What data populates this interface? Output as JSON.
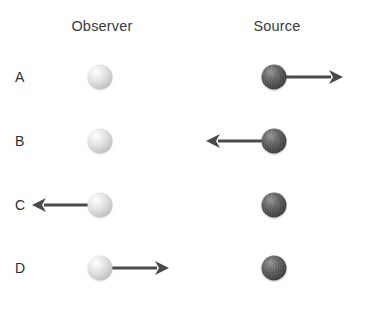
{
  "figure": {
    "background_color": "#ffffff",
    "width": 367,
    "height": 310
  },
  "columns": [
    {
      "key": "observer",
      "label": "Observer",
      "center_x": 102
    },
    {
      "key": "source",
      "label": "Source",
      "center_x": 277
    }
  ],
  "colors": {
    "light_sphere": "#dcdcdc",
    "dark_sphere": "#3f3f3f",
    "arrow": "#4a4a4a",
    "text": "#2e2e2e",
    "header_text": "#3a3a3a"
  },
  "rows": [
    {
      "label": "A",
      "center_y": 77,
      "observer": {
        "sphere": "light",
        "x": 100,
        "motion": "stationary",
        "arrow_label": ""
      },
      "source": {
        "sphere": "dark",
        "x": 274,
        "motion": "right",
        "arrow_label": "moving right"
      }
    },
    {
      "label": "B",
      "center_y": 141,
      "observer": {
        "sphere": "light",
        "x": 100,
        "motion": "stationary",
        "arrow_label": ""
      },
      "source": {
        "sphere": "dark",
        "x": 274,
        "motion": "left",
        "arrow_label": "moving left"
      }
    },
    {
      "label": "C",
      "center_y": 205,
      "observer": {
        "sphere": "light",
        "x": 100,
        "motion": "left",
        "arrow_label": "moving left"
      },
      "source": {
        "sphere": "dark",
        "x": 274,
        "motion": "stationary",
        "arrow_label": ""
      }
    },
    {
      "label": "D",
      "center_y": 268,
      "observer": {
        "sphere": "light",
        "x": 100,
        "motion": "right",
        "arrow_label": "moving right"
      },
      "source": {
        "sphere": "dark",
        "x": 274,
        "motion": "stationary",
        "arrow_label": ""
      }
    }
  ],
  "arrow_geometry": {
    "length": 58,
    "shaft_thickness": 3,
    "head_length": 14,
    "head_half_width": 7,
    "gap_from_sphere": 0
  }
}
